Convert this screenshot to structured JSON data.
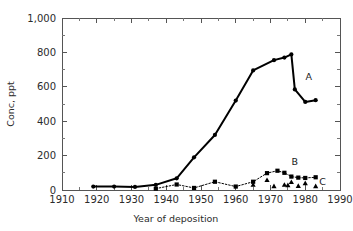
{
  "chart_data": {
    "type": "line",
    "title": "",
    "xlabel": "Year of deposition",
    "ylabel": "Conc, ppt",
    "xlim": [
      1910,
      1990
    ],
    "ylim": [
      0,
      1000
    ],
    "xticks": [
      1910,
      1920,
      1930,
      1940,
      1950,
      1960,
      1970,
      1980,
      1990
    ],
    "xticklabels": [
      "1910",
      "1920",
      "1930",
      "1940",
      "1950",
      "1960",
      "1970",
      "1980",
      "1990"
    ],
    "yticks": [
      0,
      200,
      400,
      600,
      800,
      1000
    ],
    "yticklabels": [
      "0",
      "200",
      "400",
      "600",
      "800",
      "1,000"
    ],
    "minor_x_interval": 5,
    "minor_y_interval": 100,
    "grid": false,
    "legend_position": "inline-annotations",
    "series": [
      {
        "name": "A",
        "marker": "circle",
        "linestyle": "solid",
        "linewidth": 2,
        "color": "#000000",
        "annotation": "A",
        "points": [
          {
            "x": 1919,
            "y": 20
          },
          {
            "x": 1925,
            "y": 20
          },
          {
            "x": 1931,
            "y": 18
          },
          {
            "x": 1937,
            "y": 30
          },
          {
            "x": 1943,
            "y": 68
          },
          {
            "x": 1948,
            "y": 190
          },
          {
            "x": 1954,
            "y": 320
          },
          {
            "x": 1960,
            "y": 520
          },
          {
            "x": 1965,
            "y": 695
          },
          {
            "x": 1971,
            "y": 755
          },
          {
            "x": 1974,
            "y": 770
          },
          {
            "x": 1976,
            "y": 788
          },
          {
            "x": 1977,
            "y": 585
          },
          {
            "x": 1980,
            "y": 512
          },
          {
            "x": 1983,
            "y": 522
          }
        ]
      },
      {
        "name": "B",
        "marker": "square",
        "linestyle": "dotted",
        "linewidth": 1,
        "color": "#000000",
        "annotation": "B",
        "points": [
          {
            "x": 1937,
            "y": 8
          },
          {
            "x": 1943,
            "y": 32
          },
          {
            "x": 1948,
            "y": 12
          },
          {
            "x": 1954,
            "y": 48
          },
          {
            "x": 1960,
            "y": 20
          },
          {
            "x": 1965,
            "y": 48
          },
          {
            "x": 1969,
            "y": 98
          },
          {
            "x": 1972,
            "y": 112
          },
          {
            "x": 1974,
            "y": 100
          },
          {
            "x": 1976,
            "y": 78
          },
          {
            "x": 1978,
            "y": 72
          },
          {
            "x": 1980,
            "y": 70
          },
          {
            "x": 1983,
            "y": 74
          }
        ]
      },
      {
        "name": "C",
        "marker": "triangle",
        "linestyle": "none",
        "linewidth": 0,
        "color": "#000000",
        "annotation": "C",
        "points": [
          {
            "x": 1965,
            "y": 30
          },
          {
            "x": 1969,
            "y": 58
          },
          {
            "x": 1971,
            "y": 22
          },
          {
            "x": 1974,
            "y": 30
          },
          {
            "x": 1975,
            "y": 28
          },
          {
            "x": 1976,
            "y": 46
          },
          {
            "x": 1978,
            "y": 24
          },
          {
            "x": 1980,
            "y": 40
          },
          {
            "x": 1983,
            "y": 22
          }
        ]
      }
    ],
    "annotations": [
      {
        "text": "A",
        "x": 1981,
        "y": 640
      },
      {
        "text": "B",
        "x": 1977,
        "y": 148
      },
      {
        "text": "C",
        "x": 1985,
        "y": 30
      }
    ]
  }
}
